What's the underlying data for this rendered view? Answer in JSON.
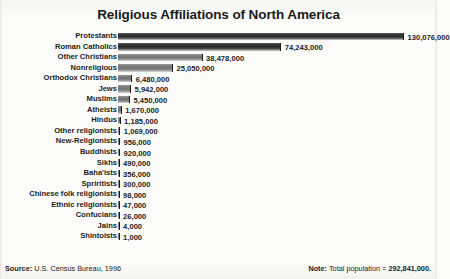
{
  "chart_data": {
    "type": "bar",
    "orientation": "horizontal",
    "title": "Religious Affiliations of North America",
    "xlabel": "",
    "ylabel": "",
    "grid": false,
    "legend": null,
    "xlim": [
      0,
      130076000
    ],
    "categories": [
      "Protestants",
      "Roman Catholics",
      "Other Christians",
      "Nonreligious",
      "Orthodox Christians",
      "Jews",
      "Muslims",
      "Atheists",
      "Hindus",
      "Other religionists",
      "New-Religionists",
      "Buddhists",
      "Sikhs",
      "Baha'ists",
      "Spriritists",
      "Chinese folk religionists",
      "Ethnic religionists",
      "Confucians",
      "Jains",
      "Shintoists"
    ],
    "values": [
      130076000,
      74243000,
      38478000,
      25050000,
      6480000,
      5942000,
      5450000,
      1670000,
      1185000,
      1069000,
      956000,
      920000,
      490000,
      356000,
      300000,
      98000,
      47000,
      26000,
      4000,
      1000
    ],
    "value_labels": [
      "130,076,000",
      "74,243,000",
      "38,478,000",
      "25,050,000",
      "6,480,000",
      "5,942,000",
      "5,450,000",
      "1,670,000",
      "1,185,000",
      "1,069,000",
      "956,000",
      "920,000",
      "490,000",
      "356,000",
      "300,000",
      "98,000",
      "47,000",
      "26,000",
      "4,000",
      "1,000"
    ],
    "bar_color": "#2a2a2a",
    "bar_color_light": "#717171"
  },
  "footer": {
    "source_label": "Source:",
    "source_text": "U.S. Census Bureau, 1996",
    "note_label": "Note:",
    "note_text": "Total population = ",
    "note_value": "292,841,000."
  }
}
